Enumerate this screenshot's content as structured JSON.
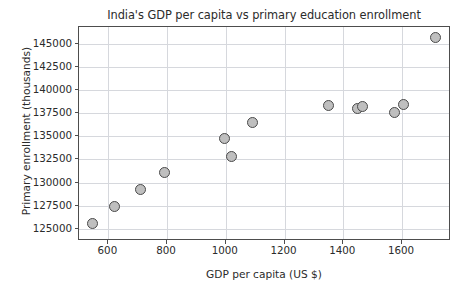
{
  "chart_data": {
    "type": "scatter",
    "title": "India's GDP per capita vs primary education enrollment",
    "xlabel": "GDP per capita (US $)",
    "ylabel": "Primary enrollment (thousands)",
    "xlim": [
      500,
      1760
    ],
    "ylim": [
      123900,
      146800
    ],
    "xticks": [
      600,
      800,
      1000,
      1200,
      1400,
      1600
    ],
    "xtick_labels": [
      "600",
      "800",
      "1000",
      "1200",
      "1400",
      "1600"
    ],
    "yticks": [
      125000,
      127500,
      130000,
      132500,
      135000,
      137500,
      140000,
      142500,
      145000
    ],
    "ytick_labels": [
      "125000",
      "127500",
      "130000",
      "132500",
      "135000",
      "137500",
      "140000",
      "142500",
      "145000"
    ],
    "grid": true,
    "legend": null,
    "marker_face_color": "#bfbfbf",
    "marker_edge_color": "#4a4a4a",
    "grid_color": "#d6d8dd",
    "axes_color": "#4d4d4d",
    "text_color": "#2b2b2b",
    "background_color": "#ffffff",
    "points": [
      {
        "x": 545,
        "y": 125600
      },
      {
        "x": 620,
        "y": 127400
      },
      {
        "x": 710,
        "y": 129200
      },
      {
        "x": 790,
        "y": 131100
      },
      {
        "x": 995,
        "y": 134800
      },
      {
        "x": 1020,
        "y": 132800
      },
      {
        "x": 1090,
        "y": 136500
      },
      {
        "x": 1350,
        "y": 138300
      },
      {
        "x": 1450,
        "y": 138000
      },
      {
        "x": 1465,
        "y": 138200
      },
      {
        "x": 1575,
        "y": 137600
      },
      {
        "x": 1605,
        "y": 138400
      },
      {
        "x": 1715,
        "y": 145700
      }
    ]
  }
}
